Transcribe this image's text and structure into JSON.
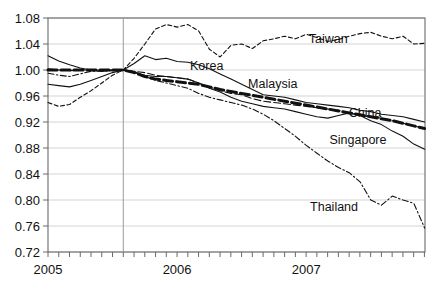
{
  "chart_data": {
    "type": "line",
    "title": "",
    "subtitle": "",
    "xlabel": "",
    "ylabel": "",
    "xlim": [
      2005.0,
      2007.92
    ],
    "ylim": [
      0.72,
      1.08
    ],
    "grid": true,
    "legend_position": "inline-labels",
    "y_ticks": [
      "1.08",
      "1.04",
      "1.00",
      "0.96",
      "0.92",
      "0.88",
      "0.84",
      "0.80",
      "0.76",
      "0.72"
    ],
    "y_tick_values": [
      1.08,
      1.04,
      1.0,
      0.96,
      0.92,
      0.88,
      0.84,
      0.8,
      0.76,
      0.72
    ],
    "x_ticks": [
      "2005",
      "2006",
      "2007"
    ],
    "x_tick_values": [
      2005.0,
      2006.0,
      2007.0
    ],
    "x_minor_tick_step": 0.0833,
    "reference_line_x": 2005.583,
    "x": [
      2005.0,
      2005.083,
      2005.167,
      2005.25,
      2005.333,
      2005.417,
      2005.5,
      2005.583,
      2005.667,
      2005.75,
      2005.833,
      2005.917,
      2006.0,
      2006.083,
      2006.167,
      2006.25,
      2006.333,
      2006.417,
      2006.5,
      2006.583,
      2006.667,
      2006.75,
      2006.833,
      2006.917,
      2007.0,
      2007.083,
      2007.167,
      2007.25,
      2007.333,
      2007.417,
      2007.5,
      2007.583,
      2007.667,
      2007.75,
      2007.833,
      2007.917
    ],
    "series": [
      {
        "name": "Taiwan",
        "style": "dashed-thin",
        "label_x": 2007.02,
        "label_y": 1.042,
        "values": [
          0.95,
          0.944,
          0.947,
          0.958,
          0.968,
          0.98,
          0.992,
          1.0,
          1.018,
          1.04,
          1.063,
          1.07,
          1.066,
          1.07,
          1.06,
          1.032,
          1.02,
          1.038,
          1.04,
          1.033,
          1.045,
          1.048,
          1.052,
          1.048,
          1.055,
          1.05,
          1.044,
          1.047,
          1.052,
          1.056,
          1.058,
          1.052,
          1.048,
          1.052,
          1.04,
          1.041
        ]
      },
      {
        "name": "Korea",
        "style": "solid-thin",
        "label_x": 2006.1,
        "label_y": 1.0,
        "values": [
          1.022,
          1.014,
          1.008,
          1.003,
          1.0,
          0.998,
          1.0,
          1.0,
          1.01,
          1.022,
          1.016,
          1.018,
          1.013,
          1.012,
          1.008,
          1.002,
          0.994,
          0.986,
          0.978,
          0.97,
          0.962,
          0.96,
          0.958,
          0.954,
          0.95,
          0.948,
          0.946,
          0.944,
          0.942,
          0.938,
          0.936,
          0.932,
          0.93,
          0.928,
          0.924,
          0.92
        ]
      },
      {
        "name": "Malaysia",
        "style": "dashed-thin-long",
        "label_x": 2006.55,
        "label_y": 0.972,
        "values": [
          1.002,
          1.0,
          0.999,
          1.0,
          1.0,
          1.0,
          1.0,
          1.0,
          0.998,
          0.996,
          0.992,
          0.99,
          0.988,
          0.986,
          0.98,
          0.974,
          0.968,
          0.964,
          0.962,
          0.956,
          0.952,
          0.95,
          0.948,
          0.946,
          0.944,
          0.942,
          0.94,
          0.938,
          0.934,
          0.93,
          0.928,
          0.926,
          0.922,
          0.918,
          0.914,
          0.91
        ]
      },
      {
        "name": "China",
        "style": "dashed-thick",
        "label_x": 2007.33,
        "label_y": 0.928,
        "values": [
          1.0,
          1.0,
          1.0,
          1.0,
          1.0,
          1.0,
          1.0,
          1.0,
          0.996,
          0.99,
          0.986,
          0.984,
          0.982,
          0.98,
          0.978,
          0.974,
          0.97,
          0.967,
          0.964,
          0.961,
          0.958,
          0.955,
          0.952,
          0.949,
          0.946,
          0.943,
          0.94,
          0.937,
          0.934,
          0.931,
          0.928,
          0.925,
          0.922,
          0.918,
          0.914,
          0.91
        ]
      },
      {
        "name": "Singapore",
        "style": "solid-thin",
        "label_x": 2007.18,
        "label_y": 0.886,
        "values": [
          0.978,
          0.976,
          0.974,
          0.978,
          0.984,
          0.99,
          0.996,
          1.0,
          0.996,
          0.992,
          0.99,
          0.99,
          0.988,
          0.986,
          0.98,
          0.972,
          0.966,
          0.958,
          0.952,
          0.948,
          0.944,
          0.942,
          0.94,
          0.936,
          0.932,
          0.928,
          0.926,
          0.93,
          0.934,
          0.93,
          0.922,
          0.916,
          0.906,
          0.898,
          0.886,
          0.878
        ]
      },
      {
        "name": "Thailand",
        "style": "dashdot-thin",
        "label_x": 2007.03,
        "label_y": 0.783,
        "values": [
          0.995,
          0.992,
          0.99,
          0.994,
          0.998,
          0.998,
          0.999,
          1.0,
          0.998,
          0.99,
          0.984,
          0.98,
          0.976,
          0.972,
          0.964,
          0.958,
          0.954,
          0.95,
          0.946,
          0.94,
          0.932,
          0.922,
          0.91,
          0.898,
          0.884,
          0.872,
          0.86,
          0.85,
          0.842,
          0.828,
          0.8,
          0.792,
          0.806,
          0.8,
          0.795,
          0.757
        ]
      }
    ]
  }
}
